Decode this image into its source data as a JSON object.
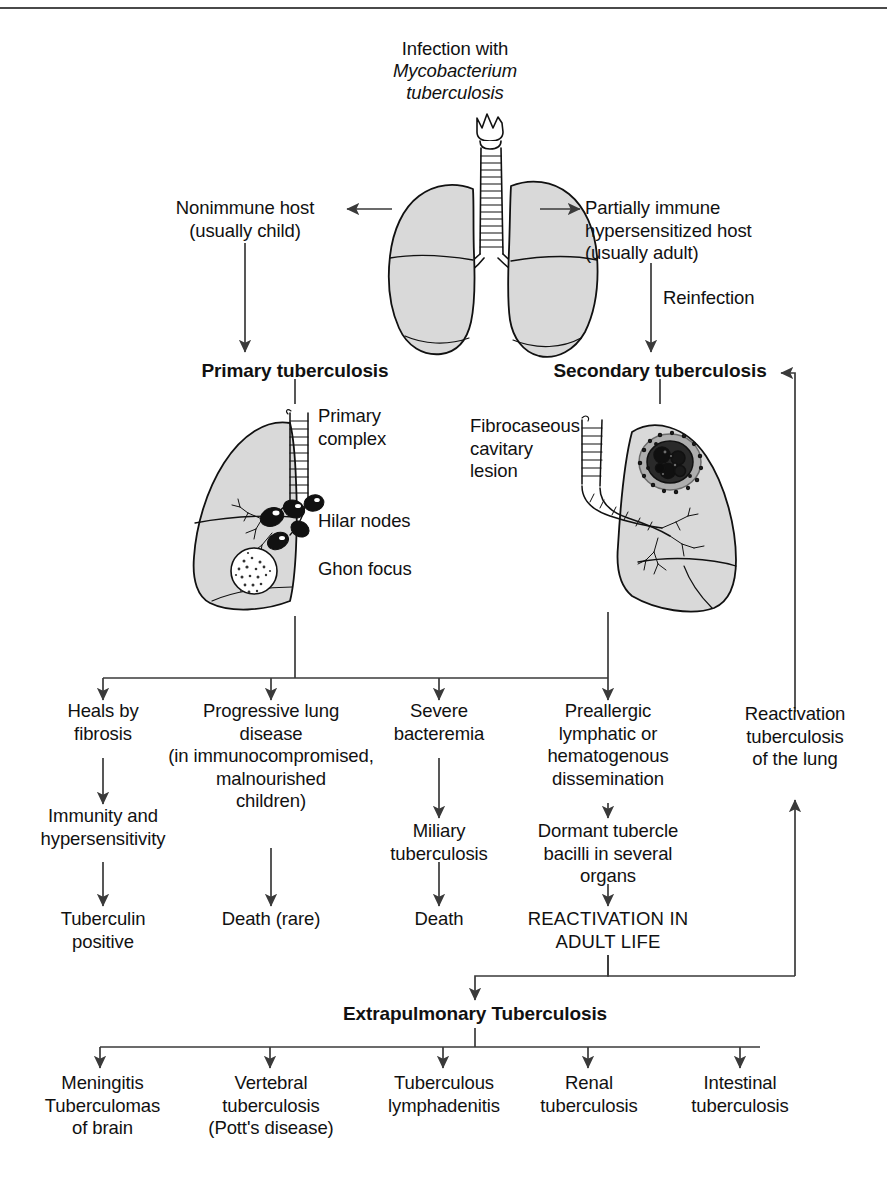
{
  "figure": {
    "title_lines": [
      "Infection with",
      "Mycobacterium",
      "tuberculosis"
    ],
    "title_line1": "Infection with",
    "title_line2": "Mycobacterium",
    "title_line3": "tuberculosis"
  },
  "branches": {
    "nonimmune": "Nonimmune host\n(usually child)",
    "partially_immune": "Partially immune\nhypersensitized host\n(usually adult)",
    "reinfection": "Reinfection",
    "primary_tb": "Primary tuberculosis",
    "secondary_tb": "Secondary tuberculosis"
  },
  "lung_annotations": {
    "primary_complex": "Primary\ncomplex",
    "hilar_nodes": "Hilar nodes",
    "ghon_focus": "Ghon focus",
    "fibrocaseous": "Fibrocaseous\ncavitary\nlesion"
  },
  "outcomes": {
    "col1": {
      "row1": "Heals by\nfibrosis",
      "row2": "Immunity and\nhypersensitivity",
      "row3": "Tuberculin\npositive"
    },
    "col2": {
      "row1": "Progressive lung\ndisease\n(in immunocompromised,\nmalnourished\nchildren)",
      "row3": "Death (rare)"
    },
    "col3": {
      "row1": "Severe\nbacteremia",
      "row2": "Miliary\ntuberculosis",
      "row3": "Death"
    },
    "col4": {
      "row1": "Preallergic\nlymphatic or\nhematogenous\ndissemination",
      "row2": "Dormant tubercle\nbacilli in several\norgans",
      "row3": "REACTIVATION IN\nADULT LIFE"
    },
    "col5": {
      "row1": "Reactivation\ntuberculosis\nof the lung"
    }
  },
  "extrapulmonary": {
    "heading": "Extrapulmonary Tuberculosis",
    "items": [
      "Meningitis\nTuberculomas\nof brain",
      "Vertebral\ntuberculosis\n(Pott's disease)",
      "Tuberculous\nlymphadenitis",
      "Renal\ntuberculosis",
      "Intestinal\ntuberculosis"
    ],
    "item0": "Meningitis\nTuberculomas\nof brain",
    "item1": "Vertebral\ntuberculosis\n(Pott's disease)",
    "item2": "Tuberculous\nlymphadenitis",
    "item3": "Renal\ntuberculosis",
    "item4": "Intestinal\ntuberculosis"
  },
  "colors": {
    "ink": "#111111",
    "line": "#3a3a3a",
    "lung_fill": "#d9d9d9",
    "lesion": "#1a1a1a",
    "rule": "#4a4a4a"
  }
}
